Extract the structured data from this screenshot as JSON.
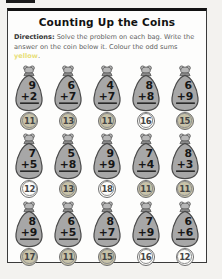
{
  "page": {
    "title": "Counting Up the Coins",
    "directions_label": "Directions:",
    "directions_text": " Solve the problem on each bag. Write the answer on the coin below it. Colour the odd sums ",
    "directions_highlight": "yellow",
    "directions_period": "."
  },
  "colors": {
    "highlight": "#e8df7a",
    "coin_odd_fill": "#c8c3a9",
    "coin_even_fill": "#fcfcfa",
    "bag_fill": "#a7a7a7",
    "bag_outline": "#4a4a4a"
  },
  "problems": [
    [
      {
        "top": "9",
        "bottom": "+2",
        "sum": "11",
        "odd": true
      },
      {
        "top": "6",
        "bottom": "+7",
        "sum": "13",
        "odd": true
      },
      {
        "top": "4",
        "bottom": "+7",
        "sum": "11",
        "odd": true
      },
      {
        "top": "8",
        "bottom": "+8",
        "sum": "16",
        "odd": false
      },
      {
        "top": "6",
        "bottom": "+9",
        "sum": "15",
        "odd": true
      }
    ],
    [
      {
        "top": "7",
        "bottom": "+5",
        "sum": "12",
        "odd": false
      },
      {
        "top": "5",
        "bottom": "+8",
        "sum": "13",
        "odd": true
      },
      {
        "top": "9",
        "bottom": "+9",
        "sum": "18",
        "odd": false
      },
      {
        "top": "7",
        "bottom": "+4",
        "sum": "11",
        "odd": true
      },
      {
        "top": "8",
        "bottom": "+3",
        "sum": "11",
        "odd": true
      }
    ],
    [
      {
        "top": "8",
        "bottom": "+9",
        "sum": "17",
        "odd": true
      },
      {
        "top": "6",
        "bottom": "+5",
        "sum": "11",
        "odd": true
      },
      {
        "top": "8",
        "bottom": "+7",
        "sum": "15",
        "odd": true
      },
      {
        "top": "7",
        "bottom": "+9",
        "sum": "16",
        "odd": false
      },
      {
        "top": "6",
        "bottom": "+6",
        "sum": "12",
        "odd": false
      }
    ]
  ]
}
